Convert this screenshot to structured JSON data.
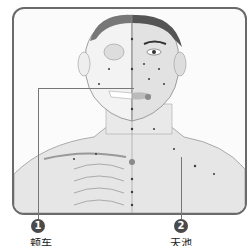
{
  "figure": {
    "colors": {
      "frame": "#6a6a6a",
      "skin": "#e8e8e8",
      "bone": "#f2f2f2",
      "hair": "#555555",
      "point": "#3a3a3a",
      "highlight_point": "#8a8a8a"
    }
  },
  "callouts": [
    {
      "number": "1",
      "caption": "颊车"
    },
    {
      "number": "2",
      "caption": "天池"
    }
  ]
}
